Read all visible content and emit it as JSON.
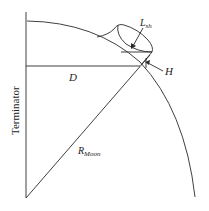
{
  "diagram": {
    "labels": {
      "terminator": "Terminator",
      "d": "D",
      "h": "H",
      "l_main": "L",
      "l_sub": "sh",
      "r_main": "R",
      "r_sub": "Moon"
    },
    "colors": {
      "stroke": "#2a2a2a",
      "text": "#222222",
      "background": "#ffffff"
    }
  }
}
